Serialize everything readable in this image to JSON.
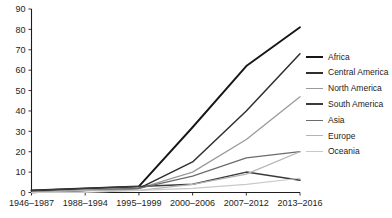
{
  "chart_data": {
    "type": "line",
    "title": "",
    "xlabel": "",
    "ylabel": "",
    "ylim": [
      0,
      90
    ],
    "ytick_step": 10,
    "grid": false,
    "legend_position": "right",
    "categories": [
      "1946–1987",
      "1988–1994",
      "1995–1999",
      "2000–2006",
      "2007–2012",
      "2013–2016"
    ],
    "yticks": [
      "0",
      "10",
      "20",
      "30",
      "40",
      "50",
      "60",
      "70",
      "80",
      "90"
    ],
    "series": [
      {
        "name": "Africa",
        "color": "#161616",
        "width": 1.9,
        "values": [
          1,
          2,
          3,
          32,
          62,
          81
        ]
      },
      {
        "name": "Central America",
        "color": "#2e2e2e",
        "width": 1.5,
        "values": [
          0,
          1,
          2,
          15,
          40,
          68
        ]
      },
      {
        "name": "North America",
        "color": "#9a9a9a",
        "width": 1.3,
        "values": [
          0,
          1,
          2,
          10,
          26,
          47
        ]
      },
      {
        "name": "South America",
        "color": "#3a3a3a",
        "width": 1.5,
        "values": [
          1,
          2,
          3,
          4,
          10,
          6
        ]
      },
      {
        "name": "Asia",
        "color": "#6b6b6b",
        "width": 1.2,
        "values": [
          0,
          1,
          2,
          8,
          17,
          20
        ]
      },
      {
        "name": "Europe",
        "color": "#b4b4b4",
        "width": 1.2,
        "values": [
          0,
          1,
          1,
          4,
          9,
          20
        ]
      },
      {
        "name": "Oceania",
        "color": "#c9c9c9",
        "width": 1.2,
        "values": [
          0,
          0,
          1,
          2,
          4,
          7
        ]
      }
    ]
  },
  "legend": {
    "entries": [
      {
        "label": "Africa"
      },
      {
        "label": "Central America"
      },
      {
        "label": "North America"
      },
      {
        "label": "South America"
      },
      {
        "label": "Asia"
      },
      {
        "label": "Europe"
      },
      {
        "label": "Oceania"
      }
    ]
  }
}
